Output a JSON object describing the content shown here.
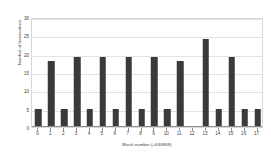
{
  "chart_data": {
    "type": "bar",
    "title": "",
    "xlabel": "Block number (+630868)",
    "ylabel": "Number of transactions",
    "categories": [
      "0",
      "1",
      "2",
      "3",
      "4",
      "5",
      "6",
      "7",
      "8",
      "9",
      "10",
      "11",
      "12",
      "13",
      "14",
      "15",
      "16",
      "17"
    ],
    "values": [
      5,
      18,
      5,
      19,
      5,
      19,
      5,
      19,
      5,
      19,
      5,
      18,
      0,
      24,
      5,
      19,
      5,
      5
    ],
    "ylim": [
      0,
      30
    ],
    "yticks": [
      0,
      5,
      10,
      15,
      20,
      25,
      30
    ],
    "ytick_labels": [
      "0",
      "5",
      "10",
      "15",
      "20",
      "25",
      "30"
    ],
    "grid": true,
    "grid_axis": "y",
    "legend": false,
    "series": [
      {
        "name": "Number of transactions",
        "values": [
          5,
          18,
          5,
          19,
          5,
          19,
          5,
          19,
          5,
          19,
          5,
          18,
          0,
          24,
          5,
          19,
          5,
          5
        ]
      }
    ],
    "colors": {
      "bar": "#3a3a3a",
      "grid": "#e2e2e2",
      "axis": "#8f8f8f",
      "text": "#3d3d3d",
      "background": "#ffffff",
      "plot_border": "#d8d8d8"
    }
  }
}
